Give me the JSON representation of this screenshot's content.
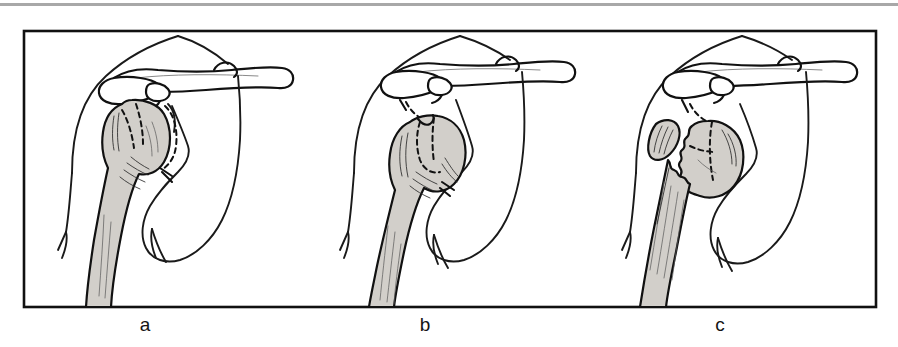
{
  "figure": {
    "kind": "medical-illustration",
    "view": "anteroposterior shoulder",
    "panel_count": 3,
    "background_color": "#ffffff",
    "frame_color": "#111111",
    "bone_shading_color": "#d2cfca",
    "line_color": "#111111",
    "top_rule_color": "#a8a8a8",
    "frame": {
      "x": 24,
      "y": 31,
      "width": 852,
      "height": 276
    },
    "top_rule": {
      "x": 0,
      "y": 3,
      "width": 898,
      "height": 3
    }
  },
  "panels": [
    {
      "id": "panel-a",
      "label": "a",
      "label_x": 145,
      "label_y": 331,
      "origin_x": 24,
      "description": "one-part (minimally displaced) proximal humerus fracture",
      "structures": [
        "clavicle",
        "acromion",
        "coracoid-process",
        "scapula",
        "glenoid",
        "humeral-head",
        "humeral-shaft",
        "rib",
        "soft-tissue-contour"
      ],
      "fracture_lines": "dashed",
      "humerus_shaded": true
    },
    {
      "id": "panel-b",
      "label": "b",
      "label_x": 425,
      "label_y": 331,
      "origin_x": 306,
      "description": "two-part fracture with impacted, angulated humeral head",
      "structures": [
        "clavicle",
        "acromion",
        "coracoid-process",
        "scapula",
        "glenoid",
        "humeral-head",
        "humeral-shaft",
        "rib",
        "soft-tissue-contour"
      ],
      "fracture_lines": "dashed",
      "humerus_shaded": true
    },
    {
      "id": "panel-c",
      "label": "c",
      "label_x": 720,
      "label_y": 331,
      "origin_x": 588,
      "description": "four-part fracture with separated head, tuberosity fragment and displaced shaft",
      "structures": [
        "clavicle",
        "acromion",
        "coracoid-process",
        "scapula",
        "glenoid",
        "humeral-head-fragment",
        "tuberosity-fragment",
        "humeral-shaft",
        "rib",
        "soft-tissue-contour"
      ],
      "fracture_lines": "dashed",
      "humerus_shaded": true
    }
  ]
}
